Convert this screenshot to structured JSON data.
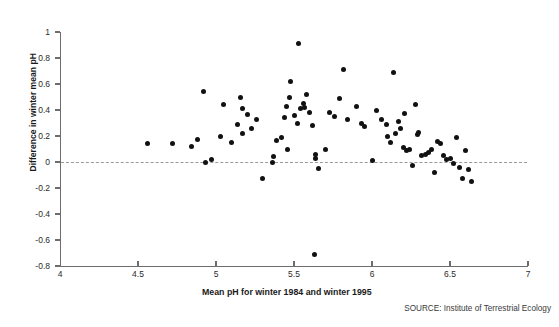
{
  "chart_data": {
    "type": "scatter",
    "title": "",
    "xlabel": "Mean pH for winter 1984 and winter 1995",
    "ylabel": "Difference in winter mean pH",
    "source": "SOURCE: Institute of Terrestrial Ecology",
    "xlim": [
      4,
      7
    ],
    "ylim": [
      -0.8,
      1
    ],
    "xticks": [
      4,
      4.5,
      5,
      5.5,
      6,
      6.5,
      7
    ],
    "xtick_labels": [
      "4",
      "4.5",
      "5",
      "5.5",
      "6",
      "6.5",
      "7"
    ],
    "yticks": [
      -0.8,
      -0.6,
      -0.4,
      -0.2,
      0,
      0.2,
      0.4,
      0.6,
      0.8,
      1
    ],
    "ytick_labels": [
      "-0.8",
      "-0.6",
      "-0.4",
      "-0.2",
      "0",
      "0.2",
      "0.4",
      "0.6",
      "0.8",
      "1"
    ],
    "grid": false,
    "legend": null,
    "reference_line": {
      "y": 0,
      "style": "dashed",
      "color": "#9a9a9a"
    },
    "marker": {
      "shape": "circle",
      "color": "#111111",
      "size": 5
    },
    "points": [
      [
        4.56,
        0.145
      ],
      [
        4.72,
        0.145
      ],
      [
        4.84,
        0.12
      ],
      [
        4.88,
        0.175
      ],
      [
        4.92,
        0.54
      ],
      [
        4.93,
        0.0
      ],
      [
        4.97,
        0.02
      ],
      [
        5.03,
        0.2
      ],
      [
        5.05,
        0.445
      ],
      [
        5.1,
        0.15
      ],
      [
        5.14,
        0.29
      ],
      [
        5.16,
        0.5
      ],
      [
        5.17,
        0.41
      ],
      [
        5.17,
        0.22
      ],
      [
        5.2,
        0.365
      ],
      [
        5.23,
        0.26
      ],
      [
        5.26,
        0.33
      ],
      [
        5.3,
        -0.13
      ],
      [
        5.36,
        0.0
      ],
      [
        5.37,
        0.04
      ],
      [
        5.39,
        0.165
      ],
      [
        5.42,
        0.185
      ],
      [
        5.44,
        0.34
      ],
      [
        5.45,
        0.43
      ],
      [
        5.46,
        0.1
      ],
      [
        5.47,
        0.5
      ],
      [
        5.48,
        0.62
      ],
      [
        5.5,
        0.36
      ],
      [
        5.52,
        0.3
      ],
      [
        5.53,
        0.91
      ],
      [
        5.54,
        0.41
      ],
      [
        5.56,
        0.45
      ],
      [
        5.57,
        0.42
      ],
      [
        5.58,
        0.52
      ],
      [
        5.6,
        0.38
      ],
      [
        5.62,
        0.28
      ],
      [
        5.63,
        -0.71
      ],
      [
        5.64,
        0.03
      ],
      [
        5.64,
        0.06
      ],
      [
        5.66,
        -0.05
      ],
      [
        5.7,
        0.1
      ],
      [
        5.73,
        0.38
      ],
      [
        5.76,
        0.35
      ],
      [
        5.79,
        0.49
      ],
      [
        5.82,
        0.71
      ],
      [
        5.84,
        0.33
      ],
      [
        5.9,
        0.43
      ],
      [
        5.93,
        0.3
      ],
      [
        5.95,
        0.27
      ],
      [
        6.0,
        0.01
      ],
      [
        6.03,
        0.4
      ],
      [
        6.06,
        0.33
      ],
      [
        6.09,
        0.29
      ],
      [
        6.1,
        0.2
      ],
      [
        6.12,
        0.15
      ],
      [
        6.14,
        0.69
      ],
      [
        6.15,
        0.22
      ],
      [
        6.17,
        0.31
      ],
      [
        6.18,
        0.26
      ],
      [
        6.2,
        0.11
      ],
      [
        6.21,
        0.37
      ],
      [
        6.22,
        0.09
      ],
      [
        6.24,
        0.1
      ],
      [
        6.26,
        -0.03
      ],
      [
        6.28,
        0.44
      ],
      [
        6.29,
        0.21
      ],
      [
        6.3,
        0.23
      ],
      [
        6.32,
        0.05
      ],
      [
        6.34,
        0.06
      ],
      [
        6.36,
        0.07
      ],
      [
        6.38,
        0.1
      ],
      [
        6.4,
        -0.08
      ],
      [
        6.42,
        0.16
      ],
      [
        6.44,
        0.14
      ],
      [
        6.46,
        0.05
      ],
      [
        6.48,
        0.02
      ],
      [
        6.5,
        0.03
      ],
      [
        6.52,
        -0.01
      ],
      [
        6.54,
        0.19
      ],
      [
        6.56,
        -0.04
      ],
      [
        6.58,
        -0.13
      ],
      [
        6.6,
        0.09
      ],
      [
        6.62,
        -0.06
      ],
      [
        6.64,
        -0.15
      ]
    ]
  }
}
